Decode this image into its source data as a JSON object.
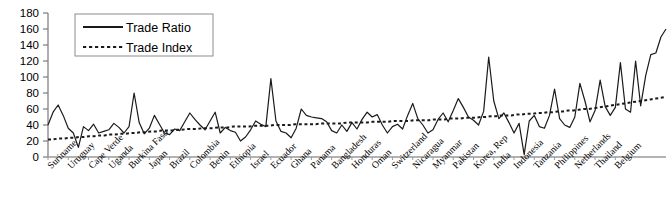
{
  "chart_data": {
    "type": "line",
    "title": "",
    "xlabel": "",
    "ylabel": "",
    "ylim": [
      0,
      180
    ],
    "ytick_step": 20,
    "yticks": [
      0,
      20,
      40,
      60,
      80,
      100,
      120,
      140,
      160,
      180
    ],
    "grid": false,
    "legend_position": "top-left",
    "legend": [
      "Trade Ratio",
      "Trade Index"
    ],
    "x_tick_labels": [
      "Suriname",
      "Uruguay",
      "Cape Verde",
      "Uganda",
      "Burkina Faso",
      "Japan",
      "Brazil",
      "Colombia",
      "Benin",
      "Ethiopia",
      "Israel",
      "Ecuador",
      "Ghana",
      "Panama",
      "Bangladesh",
      "Honduras",
      "Oman",
      "Switzerland",
      "Nicaragua",
      "Myanmar",
      "Pakistan",
      "Korea, Rep",
      "India",
      "Indonesia",
      "Tanzania",
      "Philippines",
      "Netherlands",
      "Thailand",
      "Belgium"
    ],
    "x_label_every_n_points": 4,
    "series": [
      {
        "name": "Trade Ratio",
        "style": "solid",
        "color": "#1a1a1a",
        "values": [
          40,
          56,
          65,
          52,
          36,
          30,
          12,
          38,
          33,
          41,
          30,
          32,
          34,
          42,
          37,
          30,
          38,
          80,
          43,
          29,
          36,
          52,
          41,
          30,
          28,
          35,
          33,
          44,
          55,
          47,
          40,
          34,
          45,
          56,
          30,
          37,
          33,
          31,
          20,
          25,
          34,
          45,
          41,
          38,
          98,
          45,
          32,
          30,
          24,
          36,
          60,
          52,
          50,
          49,
          48,
          44,
          33,
          30,
          40,
          32,
          43,
          35,
          47,
          56,
          50,
          53,
          40,
          30,
          38,
          41,
          35,
          52,
          67,
          48,
          40,
          30,
          34,
          47,
          55,
          44,
          58,
          73,
          62,
          50,
          46,
          40,
          57,
          125,
          70,
          48,
          55,
          43,
          30,
          42,
          3,
          45,
          52,
          38,
          36,
          52,
          85,
          48,
          40,
          37,
          50,
          92,
          70,
          44,
          58,
          96,
          63,
          52,
          62,
          118,
          60,
          56,
          120,
          64,
          102,
          128,
          130,
          150,
          160
        ]
      },
      {
        "name": "Trade Index",
        "style": "dotted",
        "color": "#1a1a1a",
        "values": [
          22,
          22,
          23,
          23,
          24,
          24,
          25,
          25,
          26,
          26,
          27,
          27,
          28,
          28,
          29,
          29,
          30,
          30,
          31,
          31,
          32,
          32,
          33,
          33,
          33,
          34,
          34,
          35,
          35,
          35,
          36,
          36,
          36,
          37,
          37,
          37,
          38,
          38,
          38,
          38,
          39,
          39,
          39,
          39,
          40,
          40,
          40,
          40,
          41,
          41,
          41,
          41,
          41,
          42,
          42,
          42,
          42,
          42,
          43,
          43,
          43,
          43,
          43,
          44,
          44,
          44,
          44,
          45,
          45,
          45,
          45,
          46,
          46,
          46,
          46,
          47,
          47,
          47,
          48,
          48,
          48,
          49,
          49,
          49,
          50,
          50,
          51,
          51,
          52,
          52,
          52,
          53,
          53,
          54,
          54,
          55,
          55,
          56,
          56,
          57,
          57,
          58,
          58,
          59,
          60,
          60,
          61,
          62,
          63,
          64,
          65,
          66,
          67,
          68,
          69,
          70,
          71,
          72,
          73,
          74,
          75
        ]
      }
    ]
  }
}
